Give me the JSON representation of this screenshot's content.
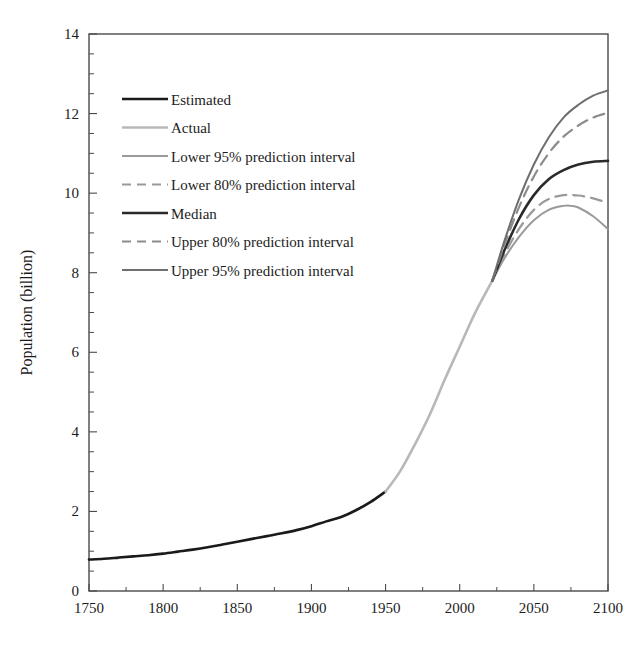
{
  "chart_data": {
    "type": "line",
    "title": "",
    "xlabel": "",
    "ylabel": "Population (billion)",
    "xlim": [
      1750,
      2100
    ],
    "ylim": [
      0,
      14
    ],
    "xticks": [
      "1750",
      "1800",
      "1850",
      "1900",
      "1950",
      "2000",
      "2050",
      "2100"
    ],
    "yticks": [
      "0",
      "2",
      "4",
      "6",
      "8",
      "10",
      "12",
      "14"
    ],
    "x_tick_step": 50,
    "x_minor_step": 25,
    "y_tick_step": 2,
    "y_minor_step": 0.5,
    "grid": false,
    "legend_position": "upper-left-inside",
    "series": [
      {
        "name": "Estimated",
        "color": "#1a1a1a",
        "style": "solid",
        "width": 2.6,
        "x": [
          1750,
          1760,
          1770,
          1780,
          1790,
          1800,
          1810,
          1820,
          1830,
          1840,
          1850,
          1860,
          1870,
          1880,
          1890,
          1900,
          1910,
          1920,
          1930,
          1940,
          1950
        ],
        "values": [
          0.79,
          0.81,
          0.84,
          0.87,
          0.9,
          0.94,
          0.99,
          1.04,
          1.1,
          1.17,
          1.24,
          1.31,
          1.38,
          1.45,
          1.53,
          1.63,
          1.75,
          1.86,
          2.03,
          2.24,
          2.5
        ]
      },
      {
        "name": "Actual",
        "color": "#b8b8b8",
        "style": "solid",
        "width": 2.6,
        "x": [
          1950,
          1960,
          1970,
          1980,
          1990,
          2000,
          2010,
          2022
        ],
        "values": [
          2.5,
          3.02,
          3.7,
          4.45,
          5.32,
          6.14,
          6.96,
          7.8
        ]
      },
      {
        "name": "Lower 95% prediction interval",
        "color": "#9a9a9a",
        "style": "solid",
        "width": 2.0,
        "x": [
          2022,
          2030,
          2040,
          2050,
          2060,
          2070,
          2075,
          2080,
          2090,
          2100
        ],
        "values": [
          7.8,
          8.35,
          8.9,
          9.32,
          9.58,
          9.68,
          9.68,
          9.64,
          9.42,
          9.1
        ]
      },
      {
        "name": "Lower 80% prediction interval",
        "color": "#9a9a9a",
        "style": "dashed",
        "width": 2.2,
        "x": [
          2022,
          2030,
          2040,
          2050,
          2060,
          2070,
          2080,
          2090,
          2100
        ],
        "values": [
          7.8,
          8.45,
          9.1,
          9.58,
          9.85,
          9.95,
          9.94,
          9.87,
          9.75
        ]
      },
      {
        "name": "Median",
        "color": "#2a2a2a",
        "style": "solid",
        "width": 2.6,
        "x": [
          2022,
          2030,
          2040,
          2050,
          2060,
          2070,
          2080,
          2090,
          2100
        ],
        "values": [
          7.8,
          8.55,
          9.35,
          9.95,
          10.35,
          10.58,
          10.72,
          10.79,
          10.81
        ]
      },
      {
        "name": "Upper 80% prediction interval",
        "color": "#8c8c8c",
        "style": "dashed",
        "width": 2.2,
        "x": [
          2022,
          2030,
          2040,
          2050,
          2060,
          2070,
          2080,
          2090,
          2100
        ],
        "values": [
          7.8,
          8.68,
          9.65,
          10.42,
          11.0,
          11.42,
          11.7,
          11.9,
          12.02
        ]
      },
      {
        "name": "Upper 95% prediction interval",
        "color": "#6e6e6e",
        "style": "solid",
        "width": 2.0,
        "x": [
          2022,
          2030,
          2040,
          2050,
          2060,
          2070,
          2080,
          2090,
          2100
        ],
        "values": [
          7.8,
          8.78,
          9.85,
          10.72,
          11.4,
          11.9,
          12.22,
          12.45,
          12.58
        ]
      }
    ],
    "annotations": [
      {
        "text": "Fan of prediction intervals originates at 2022 (~7.8 billion)"
      }
    ]
  },
  "legend": {
    "items": [
      {
        "label": "Estimated"
      },
      {
        "label": "Actual"
      },
      {
        "label": "Lower 95% prediction interval"
      },
      {
        "label": "Lower 80% prediction interval"
      },
      {
        "label": "Median"
      },
      {
        "label": "Upper 80% prediction interval"
      },
      {
        "label": "Upper 95% prediction interval"
      }
    ]
  }
}
